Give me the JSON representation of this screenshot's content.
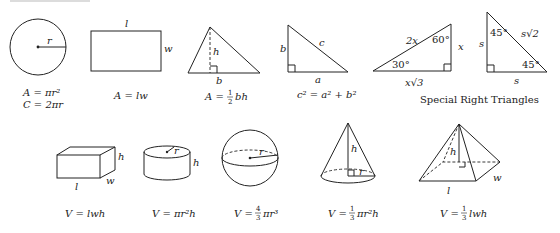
{
  "top_rule": {
    "color": "#d0d0d0"
  },
  "plane_figures": {
    "circle": {
      "labels": {
        "r": "r"
      },
      "formula_area": "A = πr²",
      "formula_circumference": "C = 2πr"
    },
    "rectangle": {
      "labels": {
        "l": "l",
        "w": "w"
      },
      "formula": "A = lw"
    },
    "triangle": {
      "labels": {
        "h": "h",
        "b": "b"
      },
      "formula_prefix": "A =",
      "fraction_num": "1",
      "fraction_den": "2",
      "formula_suffix": "bh"
    },
    "right_triangle": {
      "labels": {
        "a": "a",
        "b": "b",
        "c": "c"
      },
      "formula": "c² = a² + b²"
    },
    "triangle_30_60_90": {
      "labels": {
        "hyp": "2x",
        "angle_top": "60°",
        "short_leg": "x",
        "angle_left": "30°",
        "long_leg": "x√3"
      }
    },
    "triangle_45_45_90": {
      "labels": {
        "angle_top": "45°",
        "hyp": "s√2",
        "left_leg": "s",
        "angle_right": "45°",
        "bottom_leg": "s"
      }
    },
    "special_caption": "Special Right Triangles"
  },
  "solid_figures": {
    "box": {
      "labels": {
        "l": "l",
        "w": "w",
        "h": "h"
      },
      "formula": "V = lwh"
    },
    "cylinder": {
      "labels": {
        "r": "r",
        "h": "h"
      },
      "formula": "V = πr²h"
    },
    "sphere": {
      "labels": {
        "r": "r"
      },
      "formula_prefix": "V =",
      "fraction_num": "4",
      "fraction_den": "3",
      "formula_suffix": "πr³"
    },
    "cone": {
      "labels": {
        "h": "h",
        "r": "r"
      },
      "formula_prefix": "V =",
      "fraction_num": "1",
      "fraction_den": "3",
      "formula_suffix": "πr²h"
    },
    "pyramid": {
      "labels": {
        "h": "h",
        "l": "l",
        "w": "w"
      },
      "formula_prefix": "V =",
      "fraction_num": "1",
      "fraction_den": "3",
      "formula_suffix": "lwh"
    }
  }
}
